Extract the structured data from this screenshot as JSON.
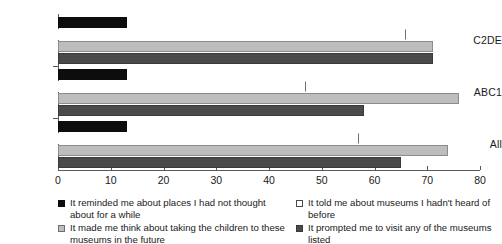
{
  "chart_data": {
    "type": "bar",
    "orientation": "horizontal",
    "title": "",
    "subtitle": "",
    "xlabel": "",
    "ylabel": "",
    "xlim": [
      0,
      80
    ],
    "xticks": [
      0,
      10,
      20,
      30,
      40,
      50,
      60,
      70,
      80
    ],
    "xtick_labels": [
      "0",
      "10",
      "20",
      "30",
      "40",
      "50",
      "60",
      "70",
      "80"
    ],
    "grid": false,
    "legend_position": "bottom",
    "categories": [
      "C2DE",
      "ABC1",
      "All"
    ],
    "series": [
      {
        "name": "It reminded me about places I had not thought about for a while",
        "color": "#0d0d0d",
        "values": [
          13,
          13,
          13
        ]
      },
      {
        "name": "It told me about museums I hadn't heard of before",
        "color": "#ffffff",
        "values": [
          66,
          47,
          57
        ]
      },
      {
        "name": "It made me think about taking the children to these museums in the future",
        "color": "#bdbdbd",
        "values": [
          71,
          76,
          74
        ]
      },
      {
        "name": "It prompted me to visit any of the museums listed",
        "color": "#4a4a4a",
        "values": [
          71,
          58,
          65
        ]
      }
    ]
  },
  "axis": {
    "tick_labels": [
      "0",
      "10",
      "20",
      "30",
      "40",
      "50",
      "60",
      "70",
      "80"
    ],
    "category_labels": [
      "C2DE",
      "ABC1",
      "All"
    ]
  },
  "legend": {
    "items": [
      {
        "label": "It reminded me about places I had not thought about for a while",
        "swatch": "black-square-icon"
      },
      {
        "label": "It told me about museums I hadn't heard of before",
        "swatch": "white-square-icon"
      },
      {
        "label": "It made me think about taking the children to these museums in the future",
        "swatch": "light-gray-square-icon"
      },
      {
        "label": "It prompted me to visit any of the museums listed",
        "swatch": "dark-gray-square-icon"
      }
    ]
  }
}
